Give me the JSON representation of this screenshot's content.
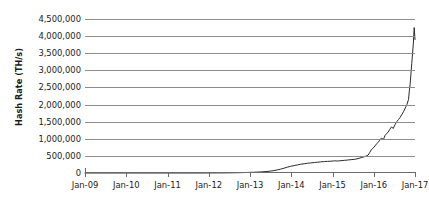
{
  "chart_data": {
    "type": "line",
    "title": "",
    "xlabel": "",
    "ylabel": "Hash Rate (TH/s)",
    "ylim": [
      0,
      4500000
    ],
    "ytick_step": 500000,
    "ytick_labels": [
      "4,500,000",
      "4,000,000",
      "3,500,000",
      "3,000,000",
      "2,500,000",
      "2,000,000",
      "1,500,000",
      "1,000,000",
      "500,000",
      "0"
    ],
    "ytick_values": [
      4500000,
      4000000,
      3500000,
      3000000,
      2500000,
      2000000,
      1500000,
      1000000,
      500000,
      0
    ],
    "xtick_labels": [
      "Jan-09",
      "Jan-10",
      "Jan-11",
      "Jan-12",
      "Jan-13",
      "Jan-14",
      "Jan-15",
      "Jan-16",
      "Jan-17"
    ],
    "xlim": [
      "Jan-09",
      "Jan-17"
    ],
    "grid": "horizontal",
    "legend": "none",
    "line_color": "#2b2b2b",
    "grid_color": "#8c8c8c",
    "axis_color": "#6b6b6b",
    "series": [
      {
        "name": "Hash Rate",
        "x": [
          2009.0,
          2009.25,
          2009.5,
          2009.75,
          2010.0,
          2010.25,
          2010.5,
          2010.75,
          2011.0,
          2011.25,
          2011.5,
          2011.75,
          2012.0,
          2012.25,
          2012.5,
          2012.75,
          2013.0,
          2013.17,
          2013.33,
          2013.5,
          2013.58,
          2013.67,
          2013.75,
          2013.83,
          2013.92,
          2014.0,
          2014.08,
          2014.17,
          2014.25,
          2014.33,
          2014.42,
          2014.5,
          2014.58,
          2014.67,
          2014.75,
          2014.83,
          2014.92,
          2015.0,
          2015.08,
          2015.17,
          2015.25,
          2015.33,
          2015.42,
          2015.5,
          2015.58,
          2015.67,
          2015.75,
          2015.83,
          2015.92,
          2016.0,
          2016.04,
          2016.08,
          2016.12,
          2016.17,
          2016.21,
          2016.25,
          2016.29,
          2016.33,
          2016.38,
          2016.42,
          2016.46,
          2016.5,
          2016.54,
          2016.58,
          2016.62,
          2016.67,
          2016.71,
          2016.75,
          2016.79,
          2016.83,
          2016.88,
          2016.92,
          2016.96,
          2017.0,
          2017.02,
          2017.04,
          2017.06,
          2017.08,
          2017.1,
          2017.12,
          2017.14,
          2017.16
        ],
        "values": [
          0,
          0,
          0,
          0,
          0,
          0,
          0,
          0,
          0,
          0,
          0,
          0,
          1000,
          2000,
          4000,
          8000,
          15000,
          22000,
          30000,
          45000,
          55000,
          70000,
          90000,
          110000,
          140000,
          170000,
          195000,
          215000,
          235000,
          255000,
          270000,
          285000,
          295000,
          305000,
          315000,
          325000,
          335000,
          340000,
          345000,
          355000,
          350000,
          360000,
          370000,
          380000,
          390000,
          400000,
          420000,
          450000,
          480000,
          520000,
          600000,
          680000,
          720000,
          790000,
          850000,
          900000,
          960000,
          1020000,
          980000,
          1100000,
          1150000,
          1200000,
          1280000,
          1350000,
          1300000,
          1420000,
          1500000,
          1560000,
          1620000,
          1700000,
          1800000,
          1900000,
          2000000,
          2150000,
          2400000,
          2600000,
          2900000,
          3200000,
          3500000,
          3800000,
          4250000,
          3900000
        ]
      }
    ]
  }
}
